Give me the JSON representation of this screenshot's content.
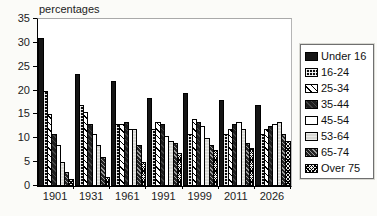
{
  "title": "percentages",
  "chart_data": {
    "type": "bar",
    "title": "",
    "ylabel": "percentages",
    "xlabel": "",
    "ylim": [
      0,
      35
    ],
    "ytick_step": 5,
    "yticks": [
      0,
      5,
      10,
      15,
      20,
      25,
      30,
      35
    ],
    "grid": false,
    "legend_position": "right",
    "categories": [
      "1901",
      "1931",
      "1961",
      "1991",
      "1999",
      "2011",
      "2026"
    ],
    "series": [
      {
        "name": "Under 16",
        "pattern": "solid-black",
        "values": [
          31,
          23.5,
          22,
          18.5,
          19.5,
          18,
          17
        ]
      },
      {
        "name": "16-24",
        "pattern": "dotted-black",
        "values": [
          20,
          17,
          13,
          12,
          11,
          11,
          11
        ]
      },
      {
        "name": "25-34",
        "pattern": "diagonal-stripe",
        "values": [
          15,
          15.5,
          13,
          13.5,
          14,
          12,
          12
        ]
      },
      {
        "name": "35-44",
        "pattern": "dark-solid",
        "values": [
          11,
          13,
          13.5,
          13,
          13.5,
          13,
          12.5
        ]
      },
      {
        "name": "45-54",
        "pattern": "white",
        "values": [
          8.5,
          11,
          12,
          10.5,
          12.5,
          13.5,
          13
        ]
      },
      {
        "name": "53-64",
        "pattern": "light-gray",
        "values": [
          5,
          8.5,
          12,
          9.5,
          10,
          12,
          13.5
        ]
      },
      {
        "name": "65-74",
        "pattern": "speckled-dark",
        "values": [
          3,
          6,
          8.5,
          9,
          8.5,
          9,
          11
        ]
      },
      {
        "name": "Over 75",
        "pattern": "crosshatch",
        "values": [
          1.5,
          2,
          5,
          7,
          7.5,
          8,
          9.5
        ]
      }
    ],
    "colors": {
      "bar_outline": "#000000",
      "axis": "#000000",
      "frame_light": "#a9a9a9",
      "background": "#fbfbf8",
      "plot_background": "#ffffff"
    }
  }
}
